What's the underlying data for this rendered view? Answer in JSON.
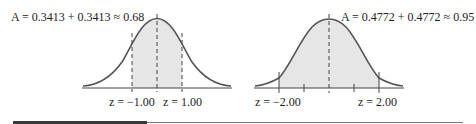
{
  "left_figure": {
    "area_label": "A = 0.3413 + 0.3413 ≈ 0.68",
    "z_left_label": "z = −1.00",
    "z_right_label": "z = 1.00",
    "shaded_range": [
      -1.0,
      1.0
    ],
    "area": 0.68
  },
  "right_figure": {
    "area_label": "A = 0.4772 + 0.4772 ≈ 0.95",
    "z_left_label": "z = −2.00",
    "z_right_label": "z = 2.00",
    "shaded_range": [
      -2.0,
      2.0
    ],
    "area": 0.95
  },
  "colors": {
    "curve": "#555555",
    "shade": "#e6e6e6",
    "axis": "#444444"
  }
}
